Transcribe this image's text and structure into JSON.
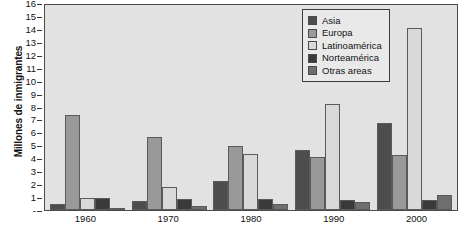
{
  "chart_data": {
    "type": "bar",
    "title": "",
    "xlabel": "",
    "ylabel": "Millones de inmigrantes",
    "ylim": [
      0,
      16
    ],
    "yticks": [
      0,
      1,
      2,
      3,
      4,
      5,
      6,
      7,
      8,
      9,
      10,
      11,
      12,
      13,
      14,
      15,
      16
    ],
    "ytick_labels": [
      "-",
      "1",
      "2",
      "3",
      "4",
      "5",
      "6",
      "7",
      "8",
      "9",
      "10",
      "11",
      "12",
      "13",
      "14",
      "15",
      "16"
    ],
    "grid": false,
    "legend_position": "top-right",
    "categories": [
      "1960",
      "1970",
      "1980",
      "1990",
      "2000"
    ],
    "series": [
      {
        "name": "Asia",
        "color": "#4d4d4d",
        "values": [
          0.5,
          0.7,
          2.3,
          4.7,
          6.8
        ]
      },
      {
        "name": "Europa",
        "color": "#999999",
        "values": [
          7.4,
          5.7,
          5.0,
          4.1,
          4.3
        ]
      },
      {
        "name": "Latinoamérica",
        "color": "#d9d9d9",
        "values": [
          0.9,
          1.8,
          4.4,
          8.3,
          14.2
        ]
      },
      {
        "name": "Norteamérica",
        "color": "#3a3a3a",
        "values": [
          0.95,
          0.85,
          0.85,
          0.75,
          0.8
        ]
      },
      {
        "name": "Otras areas",
        "color": "#6e6e6e",
        "values": [
          0.12,
          0.35,
          0.5,
          0.6,
          1.2
        ]
      }
    ]
  },
  "legend": {
    "items": [
      {
        "label": "Asia"
      },
      {
        "label": "Europa"
      },
      {
        "label": "Latinoamérica"
      },
      {
        "label": "Norteamérica"
      },
      {
        "label": "Otras areas"
      }
    ]
  },
  "axis": {
    "y_title": "Millones de inmigrantes"
  },
  "colors": {
    "plot_background": "#e2e2e2",
    "frame": "#4a4a4a",
    "page_background": "#ffffff",
    "text": "#111111"
  }
}
